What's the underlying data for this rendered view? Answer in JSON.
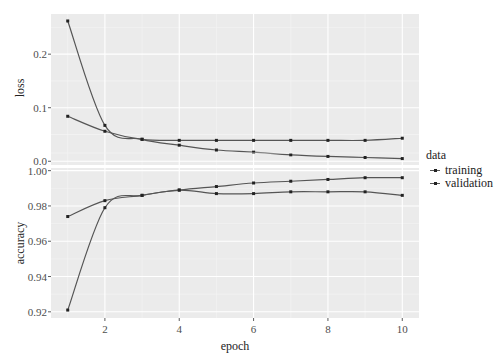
{
  "chart_data": {
    "type": "line",
    "layout": "faceted (2 stacked panels, shared x axis)",
    "x": [
      1,
      2,
      3,
      4,
      5,
      6,
      7,
      8,
      9,
      10
    ],
    "xlabel": "epoch",
    "x_ticks": [
      2,
      4,
      6,
      8,
      10
    ],
    "xlim": [
      0.55,
      10.45
    ],
    "grid": true,
    "legend_position": "right",
    "legend": {
      "title": "data",
      "entries": [
        "training",
        "validation"
      ]
    },
    "panels": [
      {
        "ylabel": "loss",
        "y_ticks": [
          "0.0",
          "0.1",
          "0.2"
        ],
        "ylim": [
          -0.007,
          0.275
        ],
        "series": [
          {
            "name": "training",
            "values": [
              0.262,
              0.067,
              0.041,
              0.03,
              0.021,
              0.017,
              0.012,
              0.009,
              0.007,
              0.005
            ]
          },
          {
            "name": "validation",
            "values": [
              0.084,
              0.056,
              0.041,
              0.039,
              0.039,
              0.039,
              0.039,
              0.039,
              0.039,
              0.043
            ]
          }
        ]
      },
      {
        "ylabel": "accuracy",
        "y_ticks": [
          "0.92",
          "0.94",
          "0.96",
          "0.98",
          "1.00"
        ],
        "ylim": [
          0.9165,
          1.0015
        ],
        "series": [
          {
            "name": "training",
            "values": [
              0.921,
              0.979,
              0.986,
              0.989,
              0.991,
              0.993,
              0.994,
              0.995,
              0.996,
              0.996
            ]
          },
          {
            "name": "validation",
            "values": [
              0.974,
              0.983,
              0.986,
              0.989,
              0.987,
              0.987,
              0.988,
              0.988,
              0.988,
              0.986
            ]
          }
        ]
      }
    ],
    "colors": {
      "panel_bg": "#ebebeb",
      "grid_major": "#ffffff",
      "grid_minor": "#f5f5f5",
      "line": "#555555",
      "point": "#222222"
    }
  }
}
